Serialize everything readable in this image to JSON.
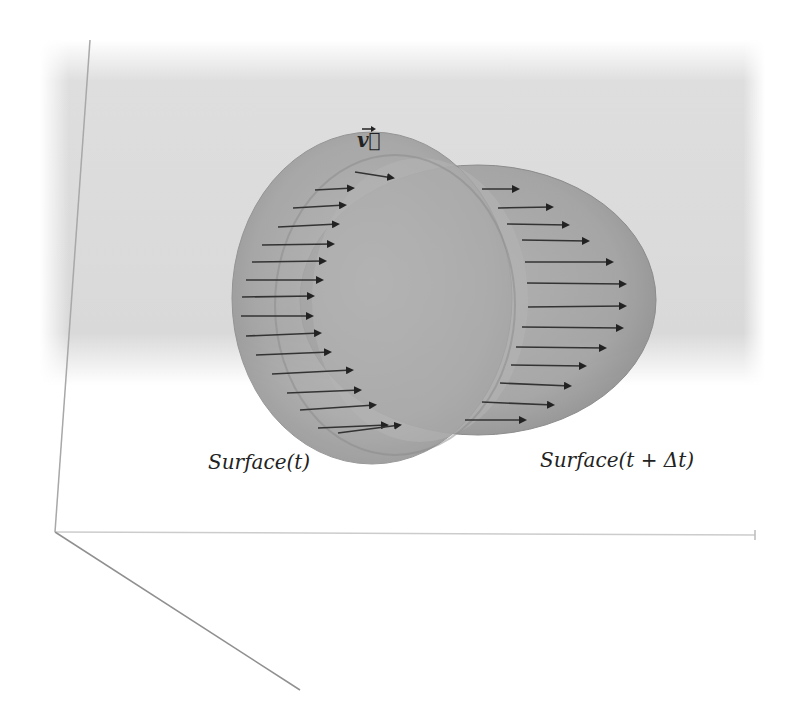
{
  "figure": {
    "labels": {
      "surface_t": "Surface(t)",
      "surface_t_dt": "Surface(t + Δt)",
      "velocity": "v⃗"
    },
    "colors": {
      "background_panel": "#d8d8d8",
      "sphere_fill": "#9a9a9a",
      "sphere_edge": "#7a7a7a",
      "arrow": "#333333",
      "axis": "#a8a8a8"
    },
    "spheres": [
      {
        "name": "surface-t",
        "cx": 370,
        "cy": 300,
        "rx": 140,
        "ry": 165
      },
      {
        "name": "surface-t-dt",
        "cx": 470,
        "cy": 300,
        "rx": 185,
        "ry": 140
      }
    ],
    "arrows_left": [
      [
        355,
        172,
        393,
        178
      ],
      [
        315,
        190,
        353,
        188
      ],
      [
        293,
        208,
        345,
        205
      ],
      [
        278,
        227,
        338,
        224
      ],
      [
        262,
        245,
        333,
        244
      ],
      [
        252,
        262,
        325,
        261
      ],
      [
        246,
        280,
        322,
        280
      ],
      [
        242,
        297,
        313,
        296
      ],
      [
        241,
        316,
        312,
        316
      ],
      [
        246,
        336,
        320,
        333
      ],
      [
        256,
        355,
        330,
        352
      ],
      [
        272,
        374,
        352,
        370
      ],
      [
        287,
        393,
        360,
        390
      ],
      [
        300,
        410,
        375,
        405
      ],
      [
        318,
        428,
        387,
        425
      ],
      [
        338,
        433,
        400,
        425
      ]
    ],
    "arrows_right": [
      [
        482,
        189,
        518,
        189
      ],
      [
        498,
        208,
        552,
        207
      ],
      [
        507,
        224,
        568,
        225
      ],
      [
        522,
        240,
        588,
        241
      ],
      [
        525,
        262,
        612,
        262
      ],
      [
        527,
        283,
        625,
        284
      ],
      [
        528,
        307,
        625,
        306
      ],
      [
        522,
        327,
        622,
        328
      ],
      [
        516,
        347,
        605,
        348
      ],
      [
        511,
        365,
        585,
        366
      ],
      [
        500,
        383,
        570,
        386
      ],
      [
        482,
        402,
        553,
        405
      ],
      [
        465,
        420,
        525,
        420
      ]
    ]
  }
}
